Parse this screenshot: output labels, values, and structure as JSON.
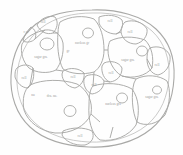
{
  "figure": {
    "kind": "hand-drawn-cross-section-sketch",
    "medium": "graphite pencil on white paper",
    "title_visible": "",
    "outline_name": "specimen-outline",
    "stroke_color": "#a9a9a7",
    "label_color": "#9c9c9a",
    "background_color": "#fefefe",
    "cell_count": 18,
    "nucleus_count": 8
  },
  "cells": [
    {
      "id": "cell-top-left-small",
      "label": "cell",
      "lx": 43,
      "ly": 23
    },
    {
      "id": "cell-left-upper",
      "label": "sugar gra.",
      "lx": 41,
      "ly": 58
    },
    {
      "id": "cell-edge-left-top",
      "label": "c.w",
      "lx": 26,
      "ly": 33
    },
    {
      "id": "cell-center-large",
      "label": "nucleus gr",
      "lx": 82,
      "ly": 44
    },
    {
      "id": "cell-center-sub",
      "label": "gr",
      "lx": 68,
      "ly": 52
    },
    {
      "id": "cell-top-right",
      "label": "cell",
      "lx": 110,
      "ly": 22
    },
    {
      "id": "cell-right-upper",
      "label": "cell",
      "lx": 130,
      "ly": 33
    },
    {
      "id": "cell-right-mid",
      "label": "sugar gra.",
      "lx": 128,
      "ly": 61
    },
    {
      "id": "cell-right-edge",
      "label": "cell",
      "lx": 157,
      "ly": 66
    },
    {
      "id": "cell-left-mid-small",
      "label": "cell",
      "lx": 24,
      "ly": 79
    },
    {
      "id": "cell-center-small-a",
      "label": "cell",
      "lx": 73,
      "ly": 78
    },
    {
      "id": "cell-center-small-b",
      "label": "cell",
      "lx": 94,
      "ly": 86
    },
    {
      "id": "cell-center-small-c",
      "label": "cell",
      "lx": 111,
      "ly": 74
    },
    {
      "id": "cell-lower-left",
      "label": "dra. nu.",
      "lx": 52,
      "ly": 97
    },
    {
      "id": "cell-lower-left-tag",
      "label": "nu",
      "lx": 33,
      "ly": 96
    },
    {
      "id": "cell-lower-center",
      "label": "nucleus gra",
      "lx": 113,
      "ly": 105
    },
    {
      "id": "cell-lower-right",
      "label": "sugar gra.",
      "lx": 152,
      "ly": 98
    },
    {
      "id": "cell-bottom-small",
      "label": "cell",
      "lx": 80,
      "ly": 137
    }
  ],
  "nuclei": [
    {
      "id": "nucleus-left-upper",
      "cx": 47,
      "cy": 44,
      "rx": 7,
      "ry": 6
    },
    {
      "id": "nucleus-center-top",
      "cx": 88,
      "cy": 33,
      "rx": 5.5,
      "ry": 5
    },
    {
      "id": "nucleus-right-mid",
      "cx": 142,
      "cy": 51,
      "rx": 5.5,
      "ry": 5
    },
    {
      "id": "nucleus-lower-left",
      "cx": 70,
      "cy": 111,
      "rx": 6,
      "ry": 5.5
    },
    {
      "id": "nucleus-lower-center",
      "cx": 122,
      "cy": 98,
      "rx": 5.5,
      "ry": 5
    },
    {
      "id": "nucleus-lower-right",
      "cx": 157,
      "cy": 90,
      "rx": 4.5,
      "ry": 4
    }
  ]
}
